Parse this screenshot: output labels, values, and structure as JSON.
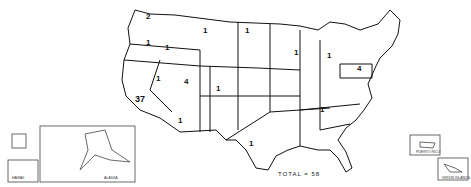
{
  "map": {
    "title": "",
    "total_label": "TOTAL = 58",
    "state_counts": [
      {
        "state": "WA",
        "count": "2",
        "x": 146,
        "y": 16
      },
      {
        "state": "OR",
        "count": "1",
        "x": 146,
        "y": 42
      },
      {
        "state": "ID",
        "count": "1",
        "x": 165,
        "y": 47
      },
      {
        "state": "MT",
        "count": "1",
        "x": 203,
        "y": 30
      },
      {
        "state": "ND",
        "count": "1",
        "x": 245,
        "y": 30
      },
      {
        "state": "CA",
        "count": "37",
        "x": 135,
        "y": 98
      },
      {
        "state": "NV",
        "count": "1",
        "x": 156,
        "y": 78
      },
      {
        "state": "UT",
        "count": "4",
        "x": 184,
        "y": 81
      },
      {
        "state": "CO",
        "count": "1",
        "x": 216,
        "y": 88
      },
      {
        "state": "AZ",
        "count": "1",
        "x": 178,
        "y": 120
      },
      {
        "state": "TX",
        "count": "1",
        "x": 249,
        "y": 143
      },
      {
        "state": "WI",
        "count": "1",
        "x": 294,
        "y": 52
      },
      {
        "state": "MI",
        "count": "1",
        "x": 327,
        "y": 55
      },
      {
        "state": "PA",
        "count": "4",
        "x": 357,
        "y": 68
      },
      {
        "state": "TN",
        "count": "1",
        "x": 320,
        "y": 109
      }
    ],
    "inset_labels": {
      "hawaii": "HAWAII",
      "alaska": "ALASKA",
      "puerto_rico": "PUERTO RICO",
      "virgin_islands": "VIRGIN ISLANDS"
    }
  }
}
